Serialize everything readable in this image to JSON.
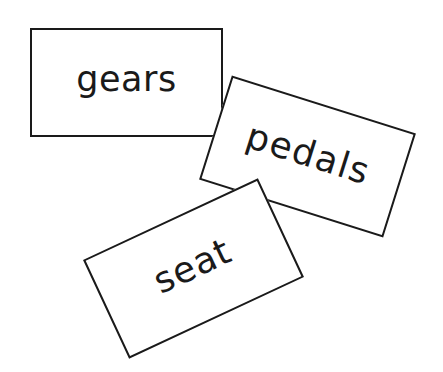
{
  "cards": [
    {
      "label": "gears",
      "rotation_deg": 0
    },
    {
      "label": "pedals",
      "rotation_deg": 17.5
    },
    {
      "label": "seat",
      "rotation_deg": -25
    }
  ],
  "colors": {
    "background": "#ffffff",
    "ink": "#1a1a1a"
  }
}
